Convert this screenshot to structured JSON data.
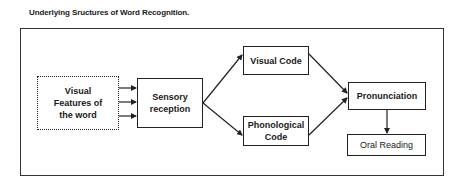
{
  "title": "Underlying Sructures of Word Recognition.",
  "nodes": {
    "visual_features": {
      "line1": "Visual",
      "line2": "Features of",
      "line3": "the word"
    },
    "sensory": {
      "line1": "Sensory",
      "line2": "reception"
    },
    "visual_code": {
      "label": "Visual Code"
    },
    "phonological_code": {
      "line1": "Phonological",
      "line2": "Code"
    },
    "pronunciation": {
      "label": "Pronunciation"
    },
    "oral_reading": {
      "label": "Oral Reading"
    }
  },
  "edges": [
    {
      "from": "visual_features",
      "to": "sensory",
      "count": 3
    },
    {
      "from": "sensory",
      "to": "visual_code"
    },
    {
      "from": "sensory",
      "to": "phonological_code"
    },
    {
      "from": "visual_code",
      "to": "pronunciation"
    },
    {
      "from": "phonological_code",
      "to": "pronunciation"
    },
    {
      "from": "pronunciation",
      "to": "oral_reading"
    }
  ]
}
